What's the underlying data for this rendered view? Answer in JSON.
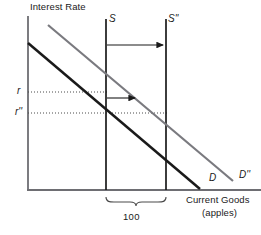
{
  "figure": {
    "type": "economics-loanable-funds-diagram",
    "axes": {
      "y_label": "Interest Rate",
      "x_label_line1": "Current Goods",
      "x_label_line2": "(apples)",
      "y_axis_x": 28,
      "x_axis_y": 190
    },
    "curves": [
      {
        "name": "demand-original",
        "label": "D",
        "color": "#1a1a1a",
        "stroke_width": 2.4,
        "x1": 28,
        "y1": 43,
        "x2": 200,
        "y2": 189
      },
      {
        "name": "demand-shifted",
        "label": "D''",
        "color": "#7a7a7f",
        "stroke_width": 2.2,
        "x1": 48,
        "y1": 25,
        "x2": 233,
        "y2": 181
      },
      {
        "name": "supply-original",
        "label": "S",
        "color": "#1a1a1a",
        "stroke_width": 1.6,
        "x": 106,
        "y_top": 19,
        "y_bottom": 190
      },
      {
        "name": "supply-shifted",
        "label": "S''",
        "color": "#1a1a1a",
        "stroke_width": 1.6,
        "x": 166,
        "y_top": 19,
        "y_bottom": 190
      }
    ],
    "equilibria": [
      {
        "name": "r",
        "rate_label": "r",
        "y": 92,
        "dotted_to_x": 106
      },
      {
        "name": "r2",
        "rate_label": "r''",
        "y": 113,
        "dotted_to_x": 166
      }
    ],
    "arrows": [
      {
        "name": "supply-shift-arrow",
        "y": 45,
        "x_start": 107,
        "x_end": 165
      },
      {
        "name": "quantity-shift-arrow",
        "y": 98,
        "x_start": 107,
        "x_end": 137
      }
    ],
    "bracket": {
      "name": "quantity-difference-bracket",
      "label": "100",
      "x_left": 106,
      "x_right": 166,
      "y": 199
    },
    "colors": {
      "ink": "#1a1a1a",
      "gray_curve": "#7a7a7f",
      "axis": "#6e6e73",
      "dotted": "#4a4a4a"
    }
  }
}
